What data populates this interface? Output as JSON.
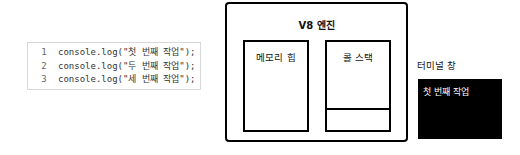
{
  "code": {
    "lines": [
      {
        "num": "1",
        "text": "console.log(\"첫 번째 작업\");"
      },
      {
        "num": "2",
        "text": "console.log(\"두 번째 작업\");"
      },
      {
        "num": "3",
        "text": "console.log(\"세 번째 작업\");"
      }
    ]
  },
  "engine": {
    "title": "V8 엔진",
    "heap_label": "메모리 힙",
    "stack_label": "콜 스택"
  },
  "terminal": {
    "label": "터미널 창",
    "output": "첫 번째 작업"
  }
}
